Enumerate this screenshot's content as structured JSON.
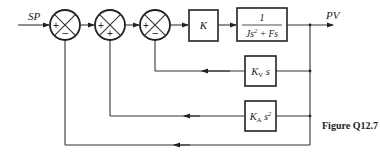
{
  "diagram": {
    "type": "control-block-diagram",
    "input_label": "SP",
    "output_label": "PV",
    "caption": "Figure Q12.7",
    "summing_junctions": [
      {
        "id": "sum1",
        "signs": {
          "left": "+",
          "bottom": "−"
        }
      },
      {
        "id": "sum2",
        "signs": {
          "left": "+",
          "bottom": "+"
        }
      },
      {
        "id": "sum3",
        "signs": {
          "left": "+",
          "bottom": "−"
        }
      }
    ],
    "blocks": {
      "gain": {
        "label": "K"
      },
      "plant": {
        "numerator": "1",
        "denominator_parts": [
          "Js",
          "2",
          " + Fs"
        ]
      },
      "velocity_feedback": {
        "main": "K",
        "sub": "V",
        "tail": " s"
      },
      "acceleration_feedback": {
        "main": "K",
        "sub": "A",
        "tail": " s",
        "sup": "2"
      }
    },
    "connections": [
      "SP → sum1 (+)",
      "sum1 → sum2 (+)",
      "sum2 → sum3 (+)",
      "sum3 → K",
      "K → 1/(Js^2+Fs)",
      "1/(Js^2+Fs) → PV",
      "PV → KV s → sum3 (−)",
      "PV → KA s^2 → sum2 (+)",
      "PV → sum1 (−) unity feedback"
    ]
  }
}
